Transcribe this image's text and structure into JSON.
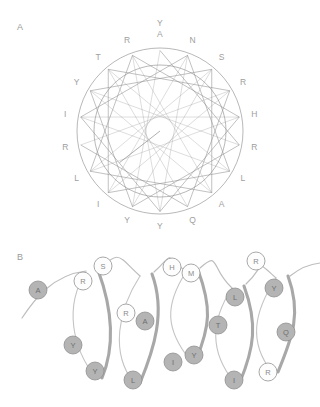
{
  "figure": {
    "panels": [
      {
        "id": "A",
        "label": "A",
        "name": "helical-wheel-panel"
      },
      {
        "id": "B",
        "label": "B",
        "name": "helical-net-panel"
      }
    ]
  },
  "chart_data": {
    "type": "diagram",
    "title": "",
    "subtitle": "",
    "panel_a": {
      "label": "A",
      "diagram_type": "helical-wheel",
      "residues_per_turn": 18,
      "angle_step_degrees": 100,
      "description": "helical wheel projection of an 18-residue amphipathic peptide",
      "has_hydrophobic_moment_arrow": true,
      "moment_arrow": {
        "from_angle_degrees": 0,
        "to_angle_degrees": 232,
        "length_fraction": 0.62
      },
      "outer_ring": true,
      "inner_ring": true,
      "positions": [
        {
          "index": 1,
          "letter": "Y",
          "angle": 0,
          "radial_offset": 1
        },
        {
          "index": 2,
          "letter": "A",
          "angle": 0,
          "radial_offset": 0
        },
        {
          "index": 3,
          "letter": "N",
          "angle": 20,
          "radial_offset": 0
        },
        {
          "index": 4,
          "letter": "S",
          "angle": 40,
          "radial_offset": 0
        },
        {
          "index": 5,
          "letter": "R",
          "angle": 60,
          "radial_offset": 0
        },
        {
          "index": 6,
          "letter": "H",
          "angle": 80,
          "radial_offset": 0
        },
        {
          "index": 7,
          "letter": "R",
          "angle": 100,
          "radial_offset": 0
        },
        {
          "index": 8,
          "letter": "L",
          "angle": 120,
          "radial_offset": 0
        },
        {
          "index": 9,
          "letter": "A",
          "angle": 140,
          "radial_offset": 0
        },
        {
          "index": 10,
          "letter": "Q",
          "angle": 160,
          "radial_offset": 0
        },
        {
          "index": 11,
          "letter": "Y",
          "angle": 180,
          "radial_offset": 0
        },
        {
          "index": 12,
          "letter": "Y",
          "angle": 200,
          "radial_offset": 0
        },
        {
          "index": 13,
          "letter": "I",
          "angle": 220,
          "radial_offset": 0
        },
        {
          "index": 14,
          "letter": "L",
          "angle": 240,
          "radial_offset": 0
        },
        {
          "index": 15,
          "letter": "R",
          "angle": 260,
          "radial_offset": 0
        },
        {
          "index": 16,
          "letter": "I",
          "angle": 280,
          "radial_offset": 0
        },
        {
          "index": 17,
          "letter": "Y",
          "angle": 300,
          "radial_offset": 0
        },
        {
          "index": 18,
          "letter": "T",
          "angle": 320,
          "radial_offset": 0
        },
        {
          "index": 19,
          "letter": "R",
          "angle": 340,
          "radial_offset": 0
        }
      ],
      "sequence_clockwise_from_top": "Y A N S R H R L A Q Y Y I L R I Y T R"
    },
    "panel_b": {
      "label": "B",
      "diagram_type": "helical-net-3d",
      "turns": 5,
      "description": "three-dimensional helical ribbon with residue spheres; filled grey = hydrophobic face, open white = hydrophilic face",
      "legend": {
        "filled": "hydrophobic residue",
        "open": "hydrophilic residue"
      },
      "residues": [
        {
          "letter": "A",
          "style": "filled",
          "cx": 38,
          "cy": 290,
          "r": 9.0
        },
        {
          "letter": "R",
          "style": "open",
          "cx": 83,
          "cy": 281,
          "r": 9.0
        },
        {
          "letter": "S",
          "style": "open",
          "cx": 103,
          "cy": 266,
          "r": 9.0
        },
        {
          "letter": "Y",
          "style": "filled",
          "cx": 73,
          "cy": 345,
          "r": 9.0
        },
        {
          "letter": "Y",
          "style": "filled",
          "cx": 95,
          "cy": 371,
          "r": 9.0
        },
        {
          "letter": "R",
          "style": "open",
          "cx": 126,
          "cy": 313,
          "r": 9.0
        },
        {
          "letter": "A",
          "style": "filled",
          "cx": 145,
          "cy": 321,
          "r": 9.0
        },
        {
          "letter": "L",
          "style": "filled",
          "cx": 133,
          "cy": 380,
          "r": 9.0
        },
        {
          "letter": "H",
          "style": "open",
          "cx": 172,
          "cy": 267,
          "r": 9.0
        },
        {
          "letter": "M",
          "style": "open",
          "cx": 191,
          "cy": 273,
          "r": 9.0
        },
        {
          "letter": "I",
          "style": "filled",
          "cx": 173,
          "cy": 362,
          "r": 9.0
        },
        {
          "letter": "Y",
          "style": "filled",
          "cx": 194,
          "cy": 355,
          "r": 9.0
        },
        {
          "letter": "L",
          "style": "filled",
          "cx": 235,
          "cy": 297,
          "r": 9.0
        },
        {
          "letter": "T",
          "style": "filled",
          "cx": 218,
          "cy": 325,
          "r": 9.0
        },
        {
          "letter": "I",
          "style": "filled",
          "cx": 234,
          "cy": 380,
          "r": 9.0
        },
        {
          "letter": "R",
          "style": "open",
          "cx": 256,
          "cy": 261,
          "r": 9.0
        },
        {
          "letter": "Y",
          "style": "filled",
          "cx": 274,
          "cy": 288,
          "r": 9.0
        },
        {
          "letter": "Q",
          "style": "filled",
          "cx": 286,
          "cy": 332,
          "r": 9.0
        },
        {
          "letter": "R",
          "style": "open",
          "cx": 268,
          "cy": 372,
          "r": 9.0
        }
      ],
      "sequence": "A R S Y Y R A L H M I Y L T I R Y Q R"
    },
    "colors": {
      "stroke": "#9a9a9a",
      "filled_residue": "#b4b4b4",
      "open_residue": "#fdfdfd",
      "label_text": "#9e9e9e",
      "background": "#ffffff"
    }
  }
}
